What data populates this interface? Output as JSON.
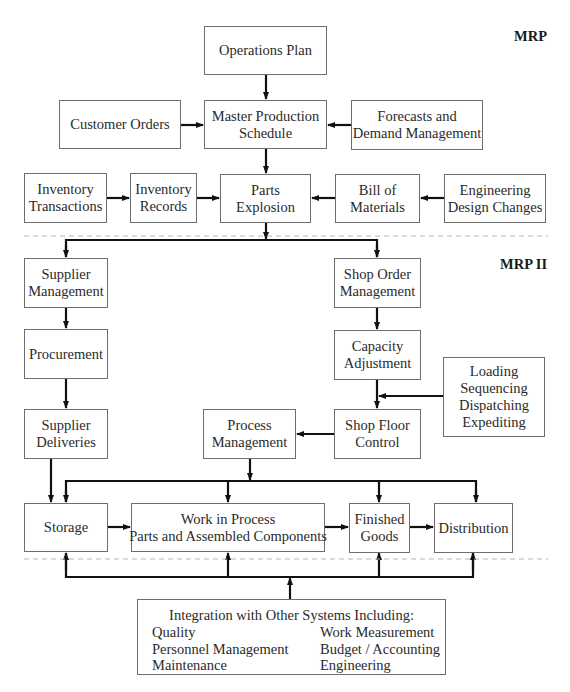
{
  "sections": {
    "mrp_label": "MRP",
    "mrp2_label": "MRP II"
  },
  "mrp": {
    "operations_plan": [
      "Operations Plan"
    ],
    "customer_orders": [
      "Customer Orders"
    ],
    "master_production_schedule": [
      "Master Production",
      "Schedule"
    ],
    "forecasts": [
      "Forecasts and",
      "Demand Management"
    ],
    "inventory_transactions": [
      "Inventory",
      "Transactions"
    ],
    "inventory_records": [
      "Inventory",
      "Records"
    ],
    "parts_explosion": [
      "Parts",
      "Explosion"
    ],
    "bill_of_materials": [
      "Bill of",
      "Materials"
    ],
    "engineering_changes": [
      "Engineering",
      "Design Changes"
    ]
  },
  "mrp2": {
    "supplier_management": [
      "Supplier",
      "Management"
    ],
    "procurement": [
      "Procurement"
    ],
    "supplier_deliveries": [
      "Supplier",
      "Deliveries"
    ],
    "shop_order_management": [
      "Shop Order",
      "Management"
    ],
    "capacity_adjustment": [
      "Capacity",
      "Adjustment"
    ],
    "loading": [
      "Loading",
      "Sequencing",
      "Dispatching",
      "Expediting"
    ],
    "shop_floor_control": [
      "Shop Floor",
      "Control"
    ],
    "process_management": [
      "Process",
      "Management"
    ],
    "storage": [
      "Storage"
    ],
    "work_in_process": [
      "Work in Process",
      "Parts and Assembled Components"
    ],
    "finished_goods": [
      "Finished",
      "Goods"
    ],
    "distribution": [
      "Distribution"
    ]
  },
  "integration": {
    "title": "Integration with Other Systems Including:",
    "left_items": [
      "Quality",
      "Personnel Management",
      "Maintenance"
    ],
    "right_items": [
      "Work Measurement",
      "Budget / Accounting",
      "Engineering"
    ]
  },
  "colors": {
    "line": "#111111",
    "box_border": "#6e6e6e",
    "dashed_separator": "#b5b5b5"
  }
}
